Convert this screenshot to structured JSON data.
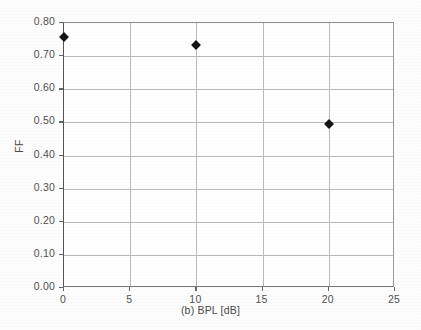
{
  "chart_data": {
    "type": "scatter",
    "title": "",
    "xlabel": "(b) BPL [dB]",
    "ylabel": "FF",
    "x": [
      0,
      10,
      20
    ],
    "values": [
      0.758,
      0.734,
      0.495
    ],
    "series": [
      {
        "name": "FF",
        "x": [
          0,
          10,
          20
        ],
        "values": [
          0.758,
          0.734,
          0.495
        ],
        "marker": "diamond",
        "marker_color": "#141414"
      }
    ],
    "xlim": [
      0,
      25
    ],
    "ylim": [
      0.0,
      0.8
    ],
    "xticks": [
      0,
      5,
      10,
      15,
      20,
      25
    ],
    "yticks": [
      0.0,
      0.1,
      0.2,
      0.3,
      0.4,
      0.5,
      0.6,
      0.7,
      0.8
    ],
    "xtick_labels": [
      "0",
      "5",
      "10",
      "15",
      "20",
      "25"
    ],
    "ytick_labels": [
      "0.00",
      "0.10",
      "0.20",
      "0.30",
      "0.40",
      "0.50",
      "0.60",
      "0.70",
      "0.80"
    ],
    "grid": true,
    "grid_color": "#b9b9b9",
    "legend": false,
    "legend_position": "none",
    "background": "#ffffff"
  }
}
